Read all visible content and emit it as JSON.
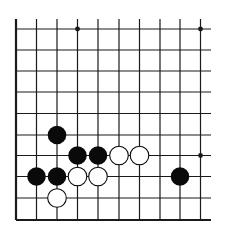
{
  "board": {
    "type": "go-diagram-fragment",
    "columns": 10,
    "rows": 10,
    "edges": [
      "left",
      "bottom"
    ],
    "colors": {
      "line": "#1a1a1a",
      "black_stone": "#0a0a0a",
      "white_stone": "#ffffff",
      "background": "#ffffff"
    },
    "star_points": [
      {
        "col": 3,
        "row": 0
      },
      {
        "col": 9,
        "row": 0
      },
      {
        "col": 9,
        "row": 6
      }
    ],
    "stones": [
      {
        "color": "black",
        "col": 2,
        "row": 5
      },
      {
        "color": "black",
        "col": 3,
        "row": 6
      },
      {
        "color": "black",
        "col": 4,
        "row": 6
      },
      {
        "color": "white",
        "col": 5,
        "row": 6
      },
      {
        "color": "white",
        "col": 6,
        "row": 6
      },
      {
        "color": "black",
        "col": 1,
        "row": 7
      },
      {
        "color": "black",
        "col": 2,
        "row": 7
      },
      {
        "color": "white",
        "col": 3,
        "row": 7
      },
      {
        "color": "white",
        "col": 4,
        "row": 7
      },
      {
        "color": "black",
        "col": 8,
        "row": 7
      },
      {
        "color": "white",
        "col": 2,
        "row": 8
      }
    ]
  }
}
